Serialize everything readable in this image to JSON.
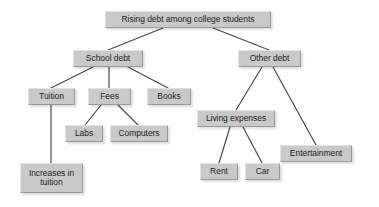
{
  "diagram": {
    "type": "tree-concept-map",
    "background_color": "#ffffff",
    "node_fill_color": "#c9c9c9",
    "node_text_color": "#1d1d1d",
    "edge_color": "#4a4a4a",
    "nodes": [
      {
        "id": "root",
        "label": "Rising debt among college students",
        "x": 105,
        "y": 11,
        "w": 166,
        "h": 17
      },
      {
        "id": "school",
        "label": "School debt",
        "x": 73,
        "y": 50,
        "w": 70,
        "h": 17
      },
      {
        "id": "other",
        "label": "Other debt",
        "x": 238,
        "y": 50,
        "w": 63,
        "h": 17
      },
      {
        "id": "tuition",
        "label": "Tuition",
        "x": 28,
        "y": 88,
        "w": 47,
        "h": 17
      },
      {
        "id": "fees",
        "label": "Fees",
        "x": 88,
        "y": 88,
        "w": 43,
        "h": 17
      },
      {
        "id": "books",
        "label": "Books",
        "x": 147,
        "y": 88,
        "w": 44,
        "h": 17
      },
      {
        "id": "labs",
        "label": "Labs",
        "x": 65,
        "y": 125,
        "w": 38,
        "h": 17
      },
      {
        "id": "computers",
        "label": "Computers",
        "x": 110,
        "y": 125,
        "w": 58,
        "h": 17
      },
      {
        "id": "increases",
        "label": "Increases in\ntuition",
        "x": 20,
        "y": 163,
        "w": 63,
        "h": 30
      },
      {
        "id": "living",
        "label": "Living expenses",
        "x": 197,
        "y": 110,
        "w": 78,
        "h": 17
      },
      {
        "id": "rent",
        "label": "Rent",
        "x": 200,
        "y": 163,
        "w": 38,
        "h": 17
      },
      {
        "id": "car",
        "label": "Car",
        "x": 245,
        "y": 163,
        "w": 35,
        "h": 17
      },
      {
        "id": "entertainment",
        "label": "Entertainment",
        "x": 280,
        "y": 145,
        "w": 72,
        "h": 17
      }
    ],
    "edges": [
      {
        "from": "root",
        "to": "school",
        "x1": 163,
        "y1": 28,
        "x2": 108,
        "y2": 50
      },
      {
        "from": "root",
        "to": "other",
        "x1": 213,
        "y1": 28,
        "x2": 269,
        "y2": 50
      },
      {
        "from": "school",
        "to": "tuition",
        "x1": 93,
        "y1": 67,
        "x2": 51,
        "y2": 88
      },
      {
        "from": "school",
        "to": "fees",
        "x1": 109,
        "y1": 67,
        "x2": 109,
        "y2": 88
      },
      {
        "from": "school",
        "to": "books",
        "x1": 128,
        "y1": 67,
        "x2": 168,
        "y2": 88
      },
      {
        "from": "fees",
        "to": "labs",
        "x1": 101,
        "y1": 105,
        "x2": 85,
        "y2": 125
      },
      {
        "from": "fees",
        "to": "computers",
        "x1": 118,
        "y1": 105,
        "x2": 138,
        "y2": 125
      },
      {
        "from": "tuition",
        "to": "increases",
        "x1": 51,
        "y1": 105,
        "x2": 51,
        "y2": 163
      },
      {
        "from": "other",
        "to": "living",
        "x1": 262,
        "y1": 67,
        "x2": 236,
        "y2": 110
      },
      {
        "from": "other",
        "to": "entertainment",
        "x1": 273,
        "y1": 67,
        "x2": 316,
        "y2": 145
      },
      {
        "from": "living",
        "to": "rent",
        "x1": 230,
        "y1": 127,
        "x2": 219,
        "y2": 163
      },
      {
        "from": "living",
        "to": "car",
        "x1": 243,
        "y1": 127,
        "x2": 262,
        "y2": 163
      }
    ]
  }
}
